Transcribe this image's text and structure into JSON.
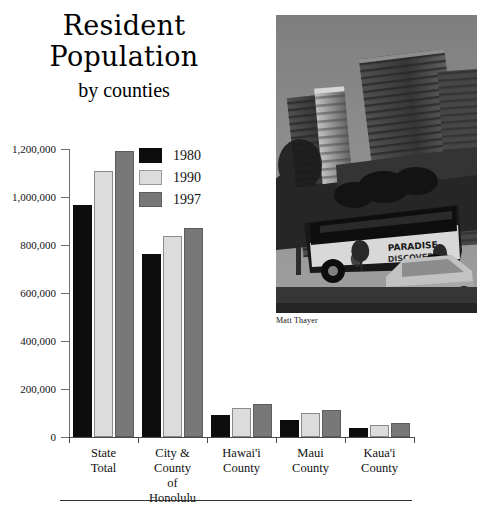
{
  "figure": {
    "title_lines": [
      "Resident",
      "Population"
    ],
    "subtitle": "by counties",
    "photo_credit": "Matt Thayer",
    "photo_alt": "Black and white photograph of Waikiki high-rise buildings with a tour bus lettered PARADISE DISCOVERED and a car parked in front",
    "photo_bus_text_line1": "PARADISE",
    "photo_bus_text_line2": "DISCOVERED"
  },
  "colors": {
    "series_1980": "#0d0d0d",
    "series_1990": "#dcdcdc",
    "series_1997": "#787878",
    "axis": "#4a4a4a",
    "text": "#111111",
    "background": "#ffffff"
  },
  "legend": {
    "position": "inside-top-left",
    "entries": [
      {
        "label": "1980",
        "color": "#0d0d0d"
      },
      {
        "label": "1990",
        "color": "#dcdcdc"
      },
      {
        "label": "1997",
        "color": "#787878"
      }
    ]
  },
  "chart_data": {
    "type": "bar",
    "title": "Resident Population",
    "subtitle": "by counties",
    "xlabel": "",
    "ylabel": "",
    "grid": false,
    "legend_position": "inside-top-left",
    "ylim": [
      0,
      1200000
    ],
    "yticks": [
      0,
      200000,
      400000,
      600000,
      800000,
      1000000,
      1200000
    ],
    "ytick_labels": [
      "0",
      "200,000",
      "400,000",
      "600,000",
      "800,000",
      "1,000,000",
      "1,200,000"
    ],
    "categories": [
      "State\nTotal",
      "City &\nCounty\nof\nHonolulu",
      "Hawai'i\nCounty",
      "Maui\nCounty",
      "Kaua'i\nCounty"
    ],
    "series": [
      {
        "name": "1980",
        "color": "#0d0d0d",
        "values": [
          965000,
          763000,
          92000,
          71000,
          39000
        ]
      },
      {
        "name": "1990",
        "color": "#dcdcdc",
        "values": [
          1108000,
          836000,
          120000,
          100000,
          51000
        ]
      },
      {
        "name": "1997",
        "color": "#787878",
        "values": [
          1193000,
          871000,
          138000,
          114000,
          57000
        ]
      }
    ]
  }
}
